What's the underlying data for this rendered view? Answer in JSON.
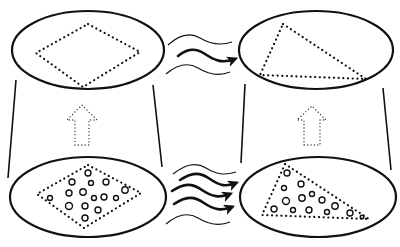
{
  "diagram": {
    "colors": {
      "stroke": "#111111",
      "background": "#ffffff"
    },
    "panels": [
      {
        "id": "top-left",
        "shape": "diamond",
        "particles": false
      },
      {
        "id": "top-right",
        "shape": "triangle",
        "particles": false
      },
      {
        "id": "bottom-left",
        "shape": "diamond",
        "particles": true
      },
      {
        "id": "bottom-right",
        "shape": "triangle",
        "particles": true
      }
    ],
    "transitions": [
      {
        "from": "top-left",
        "to": "top-right",
        "type": "wavy-arrow",
        "thick_arrows": 1,
        "thin_waves": 2
      },
      {
        "from": "bottom-left",
        "to": "bottom-right",
        "type": "wavy-arrow",
        "thick_arrows": 3,
        "thin_waves": 2
      },
      {
        "from": "bottom-left",
        "to": "top-left",
        "type": "dotted-up-arrow"
      },
      {
        "from": "bottom-right",
        "to": "top-right",
        "type": "dotted-up-arrow"
      }
    ]
  }
}
